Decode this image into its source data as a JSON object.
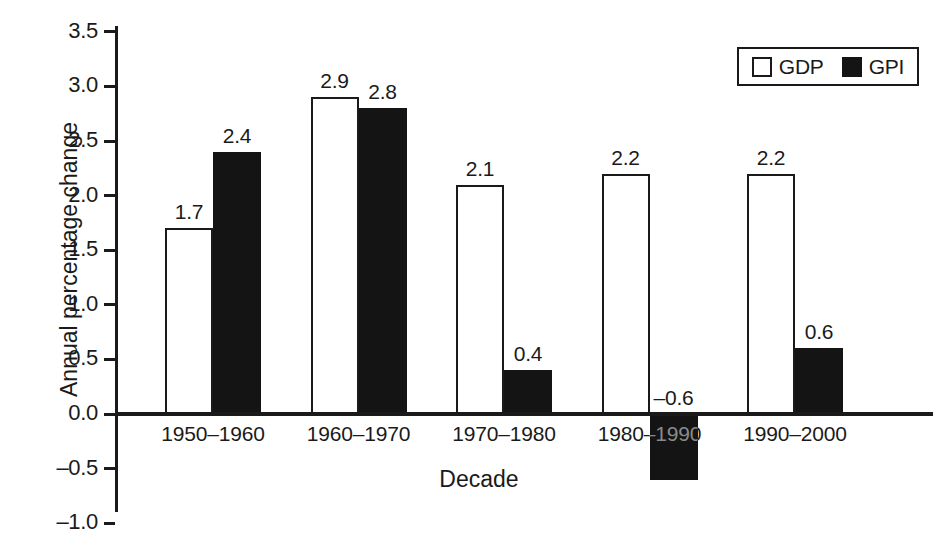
{
  "chart_data": {
    "type": "bar",
    "title": "",
    "xlabel": "Decade",
    "ylabel": "Annual percentage change",
    "categories": [
      "1950–1960",
      "1960–1970",
      "1970–1980",
      "1980–1990",
      "1990–2000"
    ],
    "series": [
      {
        "name": "GDP",
        "values": [
          1.7,
          2.9,
          2.1,
          2.2,
          2.2
        ],
        "labels": [
          "1.7",
          "2.9",
          "2.1",
          "2.2",
          "2.2"
        ],
        "style": "open-white-with-black-outline"
      },
      {
        "name": "GPI",
        "values": [
          2.4,
          2.8,
          0.4,
          -0.6,
          0.6
        ],
        "labels": [
          "2.4",
          "2.8",
          "0.4",
          "–0.6",
          "0.6"
        ],
        "style": "solid-black"
      }
    ],
    "ylim": [
      -1.0,
      3.5
    ],
    "yticks": [
      3.5,
      3.0,
      2.5,
      2.0,
      1.5,
      1.0,
      0.5,
      0.0,
      -0.5,
      -1.0
    ],
    "ytick_labels": [
      "3.5",
      "3.0",
      "2.5",
      "2.0",
      "1.5",
      "1.0",
      "0.5",
      "0.0",
      "–0.5",
      "–1.0"
    ],
    "grid": false,
    "legend_position": "top-right",
    "legend_entries": [
      "GDP",
      "GPI"
    ],
    "colors": {
      "gdp": "#ffffff",
      "gpi": "#141414",
      "axis": "#1a1a1a",
      "background": "#ffffff"
    }
  }
}
